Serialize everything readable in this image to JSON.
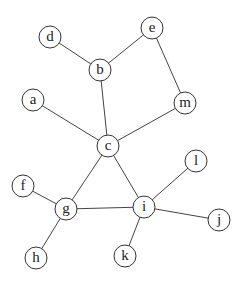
{
  "graph": {
    "node_radius": 11,
    "nodes": [
      {
        "id": "a",
        "label": "a",
        "x": 33,
        "y": 100
      },
      {
        "id": "b",
        "label": "b",
        "x": 100,
        "y": 70
      },
      {
        "id": "c",
        "label": "c",
        "x": 108,
        "y": 146
      },
      {
        "id": "d",
        "label": "d",
        "x": 50,
        "y": 37
      },
      {
        "id": "e",
        "label": "e",
        "x": 152,
        "y": 28
      },
      {
        "id": "f",
        "label": "f",
        "x": 23,
        "y": 186
      },
      {
        "id": "g",
        "label": "g",
        "x": 66,
        "y": 209
      },
      {
        "id": "h",
        "label": "h",
        "x": 36,
        "y": 258
      },
      {
        "id": "i",
        "label": "i",
        "x": 144,
        "y": 207
      },
      {
        "id": "j",
        "label": "j",
        "x": 219,
        "y": 220
      },
      {
        "id": "k",
        "label": "k",
        "x": 125,
        "y": 256
      },
      {
        "id": "l",
        "label": "l",
        "x": 196,
        "y": 161
      },
      {
        "id": "m",
        "label": "m",
        "x": 185,
        "y": 103
      }
    ],
    "edges": [
      [
        "d",
        "b"
      ],
      [
        "b",
        "e"
      ],
      [
        "e",
        "m"
      ],
      [
        "b",
        "c"
      ],
      [
        "a",
        "c"
      ],
      [
        "m",
        "c"
      ],
      [
        "c",
        "g"
      ],
      [
        "c",
        "i"
      ],
      [
        "f",
        "g"
      ],
      [
        "g",
        "h"
      ],
      [
        "g",
        "i"
      ],
      [
        "i",
        "l"
      ],
      [
        "i",
        "j"
      ],
      [
        "i",
        "k"
      ]
    ]
  }
}
